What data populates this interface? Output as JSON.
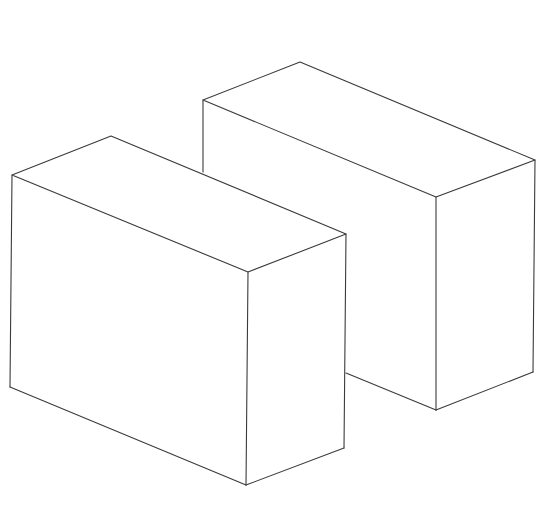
{
  "figure": {
    "stroke_color": "#3a3a3a",
    "background_color": "#ffffff"
  },
  "shapes": [
    {
      "name": "back-right-box",
      "vertices": {
        "top_left": [
          203,
          100
        ],
        "top_back": [
          300,
          62
        ],
        "top_right": [
          535,
          160
        ],
        "top_front": [
          436,
          197
        ],
        "bottom_front": [
          436,
          410
        ],
        "bottom_right": [
          533,
          372
        ],
        "hidden_left_bottom": [
          346,
          373
        ]
      }
    },
    {
      "name": "front-left-box",
      "vertices": {
        "top_left": [
          12,
          175
        ],
        "top_back": [
          111,
          136
        ],
        "top_right": [
          346,
          234
        ],
        "top_front": [
          248,
          272
        ],
        "bottom_left": [
          10,
          387
        ],
        "bottom_front": [
          246,
          485
        ],
        "bottom_right": [
          344,
          448
        ]
      }
    }
  ]
}
